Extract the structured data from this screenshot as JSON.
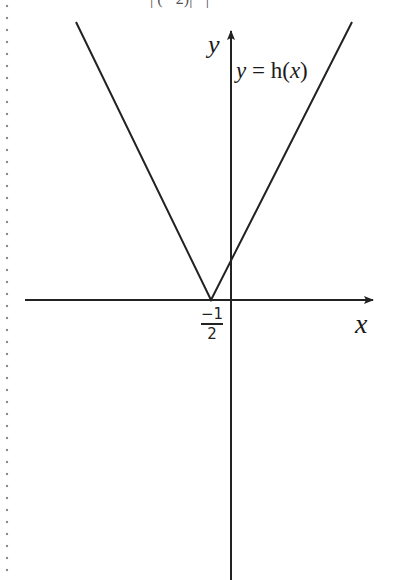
{
  "diagram": {
    "top_cropped_text": "|  (  ·  2)|  ·  |",
    "function_label": "y = h(x)",
    "function_label_parts": {
      "var": "y",
      "eq": " = ",
      "fn": "h(",
      "arg": "x",
      "close": ")"
    },
    "x_axis_label": "x",
    "y_axis_label": "y",
    "vertex_label": {
      "numerator": "−1",
      "denominator": "2"
    },
    "vertex_x": -0.5,
    "shape": "V-shaped absolute value graph with vertex on x-axis",
    "colors": {
      "line": "#222222",
      "border_dots": "#8a8a8a",
      "background": "#ffffff"
    }
  }
}
